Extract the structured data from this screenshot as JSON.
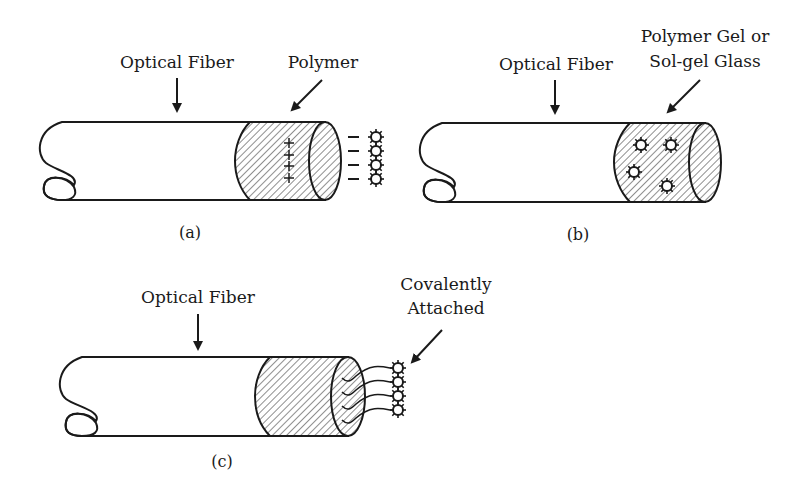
{
  "figure": {
    "panels": [
      {
        "id": "a",
        "caption": "(a)",
        "fiber_label": "Optical Fiber",
        "coating_label": "Polymer",
        "description": "Electrostatic immobilization: positive charges in polymer coating, negatively charged molecules adjacent",
        "charges": [
          "+",
          "+",
          "+",
          "+"
        ],
        "counter_charges": [
          "−",
          "−",
          "−",
          "−"
        ]
      },
      {
        "id": "b",
        "caption": "(b)",
        "fiber_label": "Optical Fiber",
        "coating_label_line1": "Polymer Gel or",
        "coating_label_line2": "Sol-gel Glass",
        "description": "Entrapment of molecules within polymer gel or sol-gel glass"
      },
      {
        "id": "c",
        "caption": "(c)",
        "fiber_label": "Optical Fiber",
        "attach_label_line1": "Covalently",
        "attach_label_line2": "Attached",
        "description": "Molecules covalently attached to fiber tip via linker chains"
      }
    ]
  },
  "colors": {
    "ink": "#1a1a1a",
    "background": "#ffffff"
  }
}
